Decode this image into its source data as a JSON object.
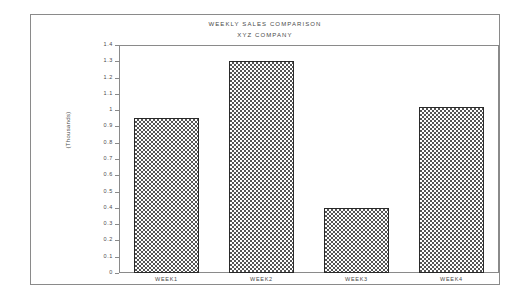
{
  "chart_data": {
    "type": "bar",
    "title": "WEEKLY SALES COMPARISON",
    "subtitle": "XYZ COMPANY",
    "xlabel": "",
    "ylabel": "(Thousands)",
    "categories": [
      "WEEK1",
      "WEEK2",
      "WEEK3",
      "WEEK4"
    ],
    "values": [
      0.95,
      1.3,
      0.4,
      1.02
    ],
    "ylim": [
      0,
      1.4
    ],
    "ytick_labels": [
      "1.4",
      "1.3",
      "1.2",
      "1.1",
      "1",
      "0.9",
      "0.8",
      "0.7",
      "0.6",
      "0.5",
      "0.4",
      "0.3",
      "0.2",
      "0.1",
      "0"
    ],
    "ytick_values": [
      1.4,
      1.3,
      1.2,
      1.1,
      1.0,
      0.9,
      0.8,
      0.7,
      0.6,
      0.5,
      0.4,
      0.3,
      0.2,
      0.1,
      0
    ],
    "grid": false,
    "legend": false,
    "bar_fill": "checkerboard-dither-50",
    "colors": {
      "frame": "#8a8a8a",
      "text": "#4a4a4a",
      "bar_outline": "#2a2a2a",
      "bar_pattern": "#555555",
      "background": "#ffffff"
    }
  }
}
